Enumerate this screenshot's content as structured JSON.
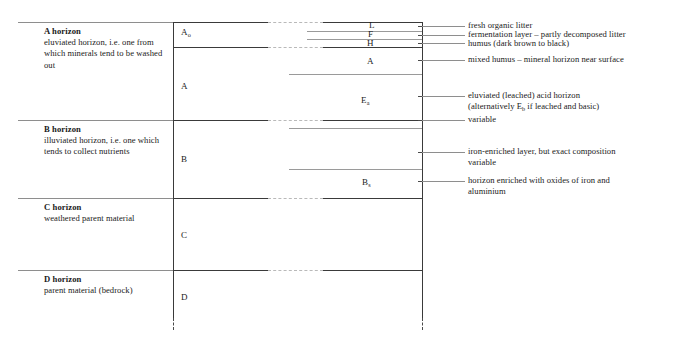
{
  "figure": {
    "type": "soil-profile-diagram",
    "colors": {
      "ink": "#1a1a1a",
      "box_edge": "#3a3a3a",
      "rule": "#8e8e8e",
      "sub_line": "#9a9a9a",
      "background": "#ffffff"
    }
  },
  "horizons": [
    {
      "id": "a",
      "title": "A horizon",
      "description": "eluviated horizon, i.e. one from which minerals tend to be washed out"
    },
    {
      "id": "b",
      "title": "B horizon",
      "description": "illuviated horizon, i.e. one which tends to collect nutrients"
    },
    {
      "id": "c",
      "title": "C horizon",
      "description": "weathered parent material"
    },
    {
      "id": "d",
      "title": "D horizon",
      "description": "parent material (bedrock)"
    }
  ],
  "profile_labels": {
    "a_zero": {
      "base": "A",
      "sub": "o"
    },
    "a": {
      "base": "A",
      "sub": ""
    },
    "b": {
      "base": "B",
      "sub": ""
    },
    "c": {
      "base": "C",
      "sub": ""
    },
    "d": {
      "base": "D",
      "sub": ""
    }
  },
  "sub_layers": [
    {
      "id": "l",
      "label": "L"
    },
    {
      "id": "f",
      "label": "F"
    },
    {
      "id": "h",
      "label": "H"
    },
    {
      "id": "a",
      "label": "A"
    },
    {
      "id": "ea",
      "base": "E",
      "sub": "a"
    },
    {
      "id": "bs",
      "base": "B",
      "sub": "s"
    }
  ],
  "annotations": [
    {
      "id": "litter",
      "lines": [
        "fresh organic litter"
      ]
    },
    {
      "id": "fermentation",
      "lines": [
        "fermentation layer – partly decomposed litter"
      ]
    },
    {
      "id": "humus",
      "lines": [
        "humus (dark brown to black)"
      ]
    },
    {
      "id": "mixed-humus",
      "lines": [
        "mixed humus – mineral horizon near surface"
      ]
    },
    {
      "id": "eluviated",
      "lines": [
        "eluviated (leached) acid horizon"
      ],
      "line2_pre": "(alternatively E",
      "line2_sub": "b",
      "line2_post": " if leached and basic)"
    },
    {
      "id": "variable",
      "lines": [
        "variable"
      ]
    },
    {
      "id": "iron-enriched",
      "lines": [
        "iron-enriched layer, but exact composition",
        "variable"
      ]
    },
    {
      "id": "oxides",
      "lines": [
        "horizon enriched with oxides of iron and",
        "aluminium"
      ]
    }
  ]
}
